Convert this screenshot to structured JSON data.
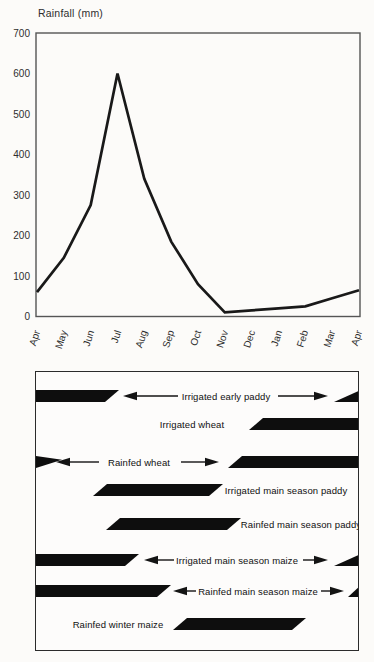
{
  "figure": {
    "background": "#fcfbf9",
    "ink": "#141414",
    "frame_color": "#555555"
  },
  "chart_data": [
    {
      "type": "line",
      "title": "Rainfall (mm)",
      "x": [
        "Apr",
        "May",
        "Jun",
        "Jul",
        "Aug",
        "Sep",
        "Oct",
        "Nov",
        "Dec",
        "Jan",
        "Feb",
        "Mar",
        "Apr"
      ],
      "values": [
        60,
        145,
        275,
        600,
        340,
        185,
        80,
        10,
        15,
        20,
        25,
        45,
        65
      ],
      "ylabel": "Rainfall (mm)",
      "xlabel": "",
      "ylim": [
        0,
        700
      ],
      "yticks": [
        0,
        100,
        200,
        300,
        400,
        500,
        600,
        700
      ],
      "grid": false,
      "legend": "none",
      "line_color": "#191919"
    },
    {
      "type": "bar",
      "subtype": "crop-calendar-season-spans",
      "title": "",
      "note": "black parallelogram bars share the Apr-to-Apr month axis of the rainfall chart; arrows mark seasons wrapping past the chart edges",
      "rows": [
        {
          "label": "Irrigated early paddy",
          "span": "mid Mar - early Jul (wraps across chart edges)",
          "wrap_arrows": true,
          "center_y": 24,
          "label_x": 190,
          "segments": [
            {
              "x": 0,
              "w": 83,
              "shape": "end-slant"
            },
            {
              "x": 298,
              "w": 27,
              "shape": "head-wedge"
            }
          ],
          "arrows": [
            {
              "dir": "left",
              "x1": 87,
              "x2": 142
            },
            {
              "dir": "right",
              "x1": 242,
              "x2": 292
            }
          ]
        },
        {
          "label": "Irrigated wheat",
          "span": "Dec - Apr",
          "wrap_arrows": false,
          "center_y": 52,
          "label_x": 156,
          "segments": [
            {
              "x": 213,
              "w": 112,
              "shape": "start-slant"
            }
          ],
          "arrows": []
        },
        {
          "label": "Rainfed wheat",
          "span": "Nov - early May (wraps across chart edges)",
          "wrap_arrows": true,
          "center_y": 90,
          "label_x": 103,
          "segments": [
            {
              "x": 0,
              "w": 26,
              "shape": "tail-wedge"
            },
            {
              "x": 192,
              "w": 133,
              "shape": "start-slant"
            }
          ],
          "arrows": [
            {
              "dir": "left",
              "x1": 20,
              "x2": 63
            },
            {
              "dir": "right",
              "x1": 145,
              "x2": 183
            }
          ]
        },
        {
          "label": "Irrigated main season paddy",
          "span": "Jun - Nov",
          "wrap_arrows": false,
          "center_y": 118,
          "label_x": 250,
          "segments": [
            {
              "x": 57,
              "w": 130,
              "shape": "both-slant"
            }
          ],
          "arrows": []
        },
        {
          "label": "Rainfed main season paddy",
          "span": "late Jun - Dec",
          "wrap_arrows": false,
          "center_y": 152,
          "label_x": 265,
          "segments": [
            {
              "x": 70,
              "w": 135,
              "shape": "both-slant"
            }
          ],
          "arrows": []
        },
        {
          "label": "Irrigated main season maize",
          "span": "Mar - Aug (wraps across chart edges)",
          "wrap_arrows": true,
          "center_y": 188,
          "label_x": 201,
          "segments": [
            {
              "x": 0,
              "w": 103,
              "shape": "end-slant"
            },
            {
              "x": 298,
              "w": 27,
              "shape": "head-wedge"
            }
          ],
          "arrows": [
            {
              "dir": "left",
              "x1": 108,
              "x2": 138
            },
            {
              "dir": "right",
              "x1": 267,
              "x2": 292
            }
          ]
        },
        {
          "label": "Rainfed main season maize",
          "span": "mid Mar - Sep (wraps across chart edges)",
          "wrap_arrows": true,
          "center_y": 219,
          "label_x": 222,
          "segments": [
            {
              "x": 0,
              "w": 135,
              "shape": "end-slant"
            },
            {
              "x": 312,
              "w": 13,
              "shape": "head-wedge"
            }
          ],
          "arrows": [
            {
              "dir": "left",
              "x1": 137,
              "x2": 160
            },
            {
              "dir": "right",
              "x1": 285,
              "x2": 308
            }
          ]
        },
        {
          "label": "Rainfed winter maize",
          "span": "Sep - Feb",
          "wrap_arrows": false,
          "center_y": 252,
          "label_x": 82,
          "segments": [
            {
              "x": 137,
              "w": 133,
              "shape": "both-slant"
            }
          ],
          "arrows": []
        }
      ]
    }
  ]
}
